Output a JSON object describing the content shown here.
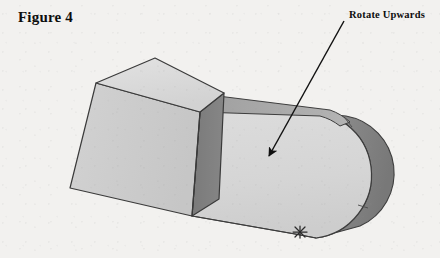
{
  "page": {
    "background_color": "#f2f1ef",
    "width": 440,
    "height": 258
  },
  "figure": {
    "caption": "Figure 4",
    "caption_position": {
      "x": 18,
      "y": 9
    }
  },
  "annotation": {
    "label": "Rotate Upwards",
    "label_position": {
      "x": 349,
      "y": 9
    },
    "arrow": {
      "start": {
        "x": 344,
        "y": 21
      },
      "end": {
        "x": 266,
        "y": 160
      },
      "head_tip": {
        "x": 266,
        "y": 161
      },
      "color": "#111111",
      "line_width": 1.4,
      "style": "solid-line-with-filled-arrowhead"
    }
  },
  "drawing": {
    "type": "isometric-3d-solid",
    "description": "Rectangular block joined to an elongated arm with a rounded end cap",
    "outline_color": "#3a3a3a",
    "parts": {
      "block": {
        "name": "rectangular-block",
        "top_face_color": "#dcdcdc",
        "left_face_color": "#cbcbcb",
        "right_face_color": "#7d7d7d",
        "top_face_points": "96,82 155,58 224,92 200,112",
        "left_face_points": "96,82 200,112 192,216 70,188",
        "right_face_points": "200,112 224,92 218,200 192,216"
      },
      "arm": {
        "name": "rounded-arm",
        "front_face_color": "#d6d6d6",
        "top_strip_color": "#a8a8a8",
        "cap_edge_color": "#8a8a8a",
        "cap_center": {
          "x": 352,
          "y": 172
        },
        "cap_radius": 58
      }
    },
    "mark": {
      "name": "asterisk-mark",
      "position": {
        "x": 300,
        "y": 232
      },
      "color": "#2a2a2a",
      "glyph": "star"
    }
  }
}
